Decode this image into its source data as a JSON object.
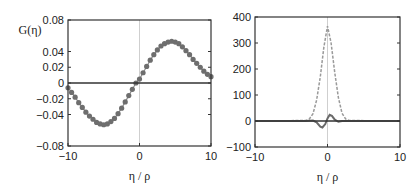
{
  "chart_data": [
    {
      "type": "line",
      "title": "",
      "ylabel": "G(η)",
      "xlabel": "η / ρ",
      "xlim": [
        -10,
        10
      ],
      "ylim": [
        -0.08,
        0.08
      ],
      "xticks": [
        "-10",
        "0",
        "10"
      ],
      "yticks": [
        "0.08",
        "0.04",
        "0.02",
        "0",
        "-0.02",
        "-0.04",
        "-0.08"
      ],
      "ytick_values": [
        0.08,
        0.04,
        0.02,
        0,
        -0.02,
        -0.04,
        -0.08
      ],
      "grid": false,
      "reference_lines": {
        "horizontal_y": 0,
        "vertical_x": 0
      },
      "series": [
        {
          "name": "G(η) curve with markers",
          "style": "line+markers",
          "x": [
            -10,
            -9.5,
            -9,
            -8.5,
            -8,
            -7.5,
            -7,
            -6.5,
            -6,
            -5.5,
            -5,
            -4.5,
            -4,
            -3.5,
            -3,
            -2.5,
            -2,
            -1.5,
            -1,
            -0.5,
            0,
            0.5,
            1,
            1.5,
            2,
            2.5,
            3,
            3.5,
            4,
            4.5,
            5,
            5.5,
            6,
            6.5,
            7,
            7.5,
            8,
            8.5,
            9,
            9.5,
            10
          ],
          "y": [
            -0.006,
            -0.012,
            -0.018,
            -0.025,
            -0.031,
            -0.037,
            -0.042,
            -0.046,
            -0.05,
            -0.052,
            -0.053,
            -0.052,
            -0.049,
            -0.045,
            -0.039,
            -0.032,
            -0.024,
            -0.016,
            -0.008,
            0.0,
            0.005,
            0.013,
            0.021,
            0.029,
            0.036,
            0.042,
            0.047,
            0.05,
            0.052,
            0.053,
            0.052,
            0.05,
            0.046,
            0.041,
            0.036,
            0.03,
            0.025,
            0.02,
            0.015,
            0.011,
            0.008
          ]
        }
      ]
    },
    {
      "type": "line",
      "title": "",
      "ylabel": "",
      "xlabel": "η / ρ",
      "xlim": [
        -10,
        10
      ],
      "ylim": [
        -100,
        400
      ],
      "xticks": [
        "-10",
        "0",
        "10"
      ],
      "yticks": [
        "400",
        "300",
        "200",
        "100",
        "0",
        "-100"
      ],
      "ytick_values": [
        400,
        300,
        200,
        100,
        0,
        -100
      ],
      "grid": false,
      "reference_lines": {
        "horizontal_y": 0,
        "vertical_x": 0
      },
      "series": [
        {
          "name": "peak (light dashed)",
          "style": "dashed",
          "x": [
            -10,
            -3,
            -2.5,
            -2,
            -1.5,
            -1,
            -0.5,
            0,
            0.5,
            1,
            1.5,
            2,
            2.5,
            3,
            10
          ],
          "y": [
            0,
            2,
            8,
            28,
            80,
            170,
            285,
            365,
            300,
            185,
            90,
            30,
            8,
            2,
            0
          ]
        },
        {
          "name": "oscillation (dark solid)",
          "style": "solid",
          "x": [
            -10,
            -3,
            -2,
            -1.5,
            -1,
            -0.7,
            -0.3,
            0,
            0.3,
            0.6,
            1,
            1.5,
            2,
            3,
            10
          ],
          "y": [
            0,
            0,
            2,
            -5,
            -22,
            -25,
            -12,
            10,
            24,
            20,
            5,
            -3,
            0,
            0,
            0
          ]
        }
      ]
    }
  ]
}
